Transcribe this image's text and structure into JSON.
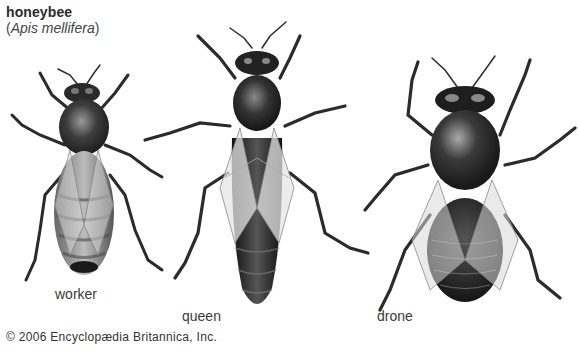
{
  "figure": {
    "title": "honeybee",
    "scientific_name_open": "(",
    "scientific_name": "Apis mellifera",
    "scientific_name_close": ")",
    "bees": [
      {
        "label": "worker"
      },
      {
        "label": "queen"
      },
      {
        "label": "drone"
      }
    ],
    "credit": "© 2006 Encyclopædia Britannica, Inc."
  }
}
